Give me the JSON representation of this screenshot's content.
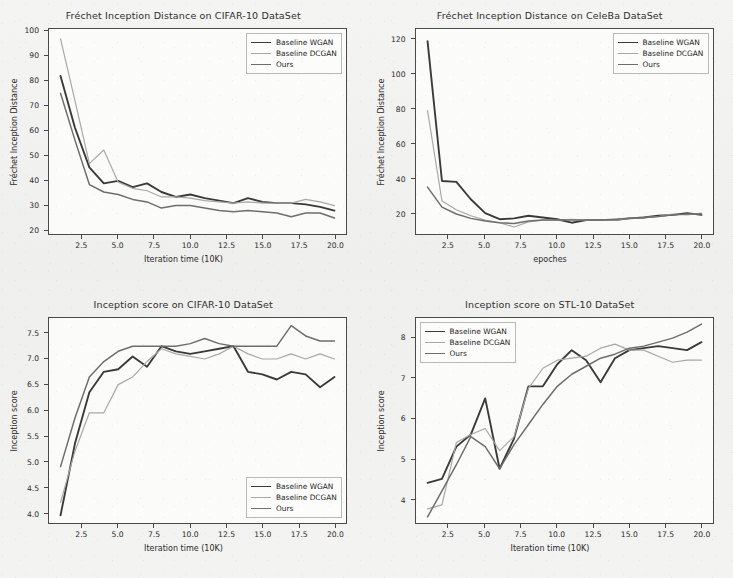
{
  "figure": {
    "background_color": "#f2f2f0",
    "panel_background_color": "#fbfbfa",
    "axis_color": "#4a4a4a"
  },
  "series_styles": [
    {
      "name": "Baseline WGAN",
      "color": "#3a3a3a",
      "width": 1.9
    },
    {
      "name": "Baseline DCGAN",
      "color": "#a8a8a8",
      "width": 1.2
    },
    {
      "name": "Ours",
      "color": "#6e6e6e",
      "width": 1.5
    }
  ],
  "chart_data": [
    {
      "id": "fid-cifar10",
      "type": "line",
      "title": "Fréchet Inception Distance on CIFAR-10 DataSet",
      "xlabel": "Iteration time (10K)",
      "ylabel": "Fréchet Inception Distance",
      "xlim": [
        0.2,
        20.8
      ],
      "ylim": [
        18,
        101
      ],
      "xticks": [
        2.5,
        5.0,
        7.5,
        10.0,
        12.5,
        15.0,
        17.5,
        20.0
      ],
      "xticklabels": [
        "2.5",
        "5.0",
        "7.5",
        "10.0",
        "12.5",
        "15.0",
        "17.5",
        "20.0"
      ],
      "yticks": [
        20,
        30,
        40,
        50,
        60,
        70,
        80,
        90,
        100
      ],
      "yticklabels": [
        "20",
        "30",
        "40",
        "50",
        "60",
        "70",
        "80",
        "90",
        "100"
      ],
      "grid": false,
      "legend_position": "upper right",
      "x": [
        1,
        2,
        3,
        4,
        5,
        6,
        7,
        8,
        9,
        10,
        11,
        12,
        13,
        14,
        15,
        16,
        17,
        18,
        19,
        20
      ],
      "series": [
        {
          "name": "Baseline WGAN",
          "values": [
            82,
            61,
            45,
            38.5,
            39.5,
            37,
            38.5,
            35,
            33,
            34,
            32.5,
            31.5,
            30.5,
            32.5,
            31,
            30.5,
            30.5,
            30,
            29,
            27.5
          ]
        },
        {
          "name": "Baseline DCGAN",
          "values": [
            97,
            72,
            46.5,
            52,
            39,
            36.5,
            35.5,
            33,
            33,
            32.5,
            31.5,
            31,
            30.5,
            31,
            30.5,
            30.5,
            30.5,
            32,
            31,
            29.5
          ]
        },
        {
          "name": "Ours",
          "values": [
            75,
            56,
            38,
            35,
            34,
            32,
            31,
            28.5,
            29.5,
            29.5,
            28.5,
            27.5,
            27,
            27.5,
            27,
            26.5,
            25,
            26.5,
            26.5,
            24.5
          ]
        }
      ]
    },
    {
      "id": "fid-celeba",
      "type": "line",
      "title": "Fréchet Inception Distance on CeleBa DataSet",
      "xlabel": "epoches",
      "ylabel": "Fréchet Inception Distance",
      "xlim": [
        0.2,
        20.8
      ],
      "ylim": [
        8,
        126
      ],
      "xticks": [
        2.5,
        5.0,
        7.5,
        10.0,
        12.5,
        15.0,
        17.5,
        20.0
      ],
      "xticklabels": [
        "2.5",
        "5.0",
        "7.5",
        "10.0",
        "12.5",
        "15.0",
        "17.5",
        "20.0"
      ],
      "yticks": [
        20,
        40,
        60,
        80,
        100,
        120
      ],
      "yticklabels": [
        "20",
        "40",
        "60",
        "80",
        "100",
        "120"
      ],
      "grid": false,
      "legend_position": "upper right",
      "x": [
        1,
        2,
        3,
        4,
        5,
        6,
        7,
        8,
        9,
        10,
        11,
        12,
        13,
        14,
        15,
        16,
        17,
        18,
        19,
        20
      ],
      "series": [
        {
          "name": "Baseline WGAN",
          "values": [
            119,
            38.5,
            38,
            28,
            20,
            16.5,
            17,
            18.5,
            17.5,
            16.5,
            14.5,
            16,
            16,
            16,
            17,
            17.5,
            18.5,
            19,
            20,
            19
          ]
        },
        {
          "name": "Baseline DCGAN",
          "values": [
            79,
            27,
            22,
            18.5,
            16,
            14.5,
            12,
            15,
            16,
            16,
            16.5,
            16,
            16,
            16,
            17,
            17.5,
            18,
            19.5,
            19,
            20
          ]
        },
        {
          "name": "Ours",
          "values": [
            35,
            23.5,
            19.5,
            17,
            15.5,
            14.5,
            14,
            15.5,
            16,
            16,
            16,
            16,
            16,
            16.5,
            17,
            17.5,
            18,
            19,
            19.5,
            19.5
          ]
        }
      ]
    },
    {
      "id": "is-cifar10",
      "type": "line",
      "title": "Inception score on CIFAR-10 DataSet",
      "xlabel": "Iteration time (10K)",
      "ylabel": "Inception score",
      "xlim": [
        0.2,
        20.8
      ],
      "ylim": [
        3.8,
        7.8
      ],
      "xticks": [
        2.5,
        5.0,
        7.5,
        10.0,
        12.5,
        15.0,
        17.5,
        20.0
      ],
      "xticklabels": [
        "2.5",
        "5.0",
        "7.5",
        "10.0",
        "12.5",
        "15.0",
        "17.5",
        "20.0"
      ],
      "yticks": [
        4.0,
        4.5,
        5.0,
        5.5,
        6.0,
        6.5,
        7.0,
        7.5
      ],
      "yticklabels": [
        "4.0",
        "4.5",
        "5.0",
        "5.5",
        "6.0",
        "6.5",
        "7.0",
        "7.5"
      ],
      "grid": false,
      "legend_position": "lower right",
      "x": [
        1,
        2,
        3,
        4,
        5,
        6,
        7,
        8,
        9,
        10,
        11,
        12,
        13,
        14,
        15,
        16,
        17,
        18,
        19,
        20
      ],
      "series": [
        {
          "name": "Baseline WGAN",
          "values": [
            3.95,
            5.35,
            6.35,
            6.75,
            6.8,
            7.05,
            6.85,
            7.25,
            7.15,
            7.1,
            7.15,
            7.2,
            7.25,
            6.75,
            6.7,
            6.6,
            6.75,
            6.7,
            6.45,
            6.65
          ]
        },
        {
          "name": "Baseline DCGAN",
          "values": [
            4.2,
            5.2,
            5.95,
            5.95,
            6.5,
            6.65,
            6.95,
            7.2,
            7.1,
            7.05,
            7,
            7.1,
            7.25,
            7.1,
            7.0,
            7.0,
            7.1,
            7.0,
            7.1,
            7.0
          ]
        },
        {
          "name": "Ours",
          "values": [
            4.9,
            5.85,
            6.65,
            6.95,
            7.15,
            7.25,
            7.25,
            7.25,
            7.25,
            7.3,
            7.4,
            7.3,
            7.25,
            7.25,
            7.25,
            7.25,
            7.65,
            7.45,
            7.35,
            7.35
          ]
        }
      ]
    },
    {
      "id": "is-stl10",
      "type": "line",
      "title": "Inception score on STL-10 DataSet",
      "xlabel": "Iteration time (10K)",
      "ylabel": "Inception score",
      "xlim": [
        0.2,
        20.8
      ],
      "ylim": [
        3.4,
        8.5
      ],
      "xticks": [
        2.5,
        5.0,
        7.5,
        10.0,
        12.5,
        15.0,
        17.5,
        20.0
      ],
      "xticklabels": [
        "2.5",
        "5.0",
        "7.5",
        "10.0",
        "12.5",
        "15.0",
        "17.5",
        "20.0"
      ],
      "yticks": [
        4,
        5,
        6,
        7,
        8
      ],
      "yticklabels": [
        "4",
        "5",
        "6",
        "7",
        "8"
      ],
      "grid": false,
      "legend_position": "upper left",
      "x": [
        1,
        2,
        3,
        4,
        5,
        6,
        7,
        8,
        9,
        10,
        11,
        12,
        13,
        14,
        15,
        16,
        17,
        18,
        19,
        20
      ],
      "series": [
        {
          "name": "Baseline WGAN",
          "values": [
            4.4,
            4.5,
            5.3,
            5.6,
            6.5,
            4.75,
            5.5,
            6.8,
            6.8,
            7.35,
            7.7,
            7.45,
            6.9,
            7.5,
            7.7,
            7.75,
            7.8,
            7.75,
            7.7,
            7.9
          ]
        },
        {
          "name": "Baseline DCGAN",
          "values": [
            3.75,
            3.85,
            5.4,
            5.6,
            5.75,
            5.2,
            5.55,
            6.75,
            7.25,
            7.45,
            7.5,
            7.55,
            7.75,
            7.85,
            7.7,
            7.7,
            7.55,
            7.4,
            7.45,
            7.45
          ]
        },
        {
          "name": "Ours",
          "values": [
            3.55,
            4.2,
            4.85,
            5.55,
            5.3,
            4.75,
            5.35,
            5.85,
            6.35,
            6.8,
            7.1,
            7.3,
            7.5,
            7.6,
            7.75,
            7.8,
            7.9,
            8.0,
            8.15,
            8.35
          ]
        }
      ]
    }
  ]
}
